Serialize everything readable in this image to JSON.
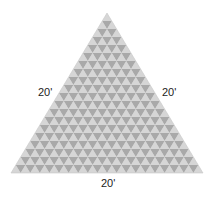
{
  "diagram": {
    "shape": "equilateral-triangle",
    "rows": 20,
    "apex": [
      107,
      13
    ],
    "base_left": [
      11,
      173
    ],
    "base_right": [
      203,
      173
    ],
    "colors": {
      "background": "#ffffff",
      "up_triangle": "#d6d6d6",
      "down_triangle": "#a9a9a9",
      "outline": "#c8c8c8"
    },
    "labels": {
      "left_side": "20'",
      "right_side": "20'",
      "bottom_side": "20'"
    }
  }
}
